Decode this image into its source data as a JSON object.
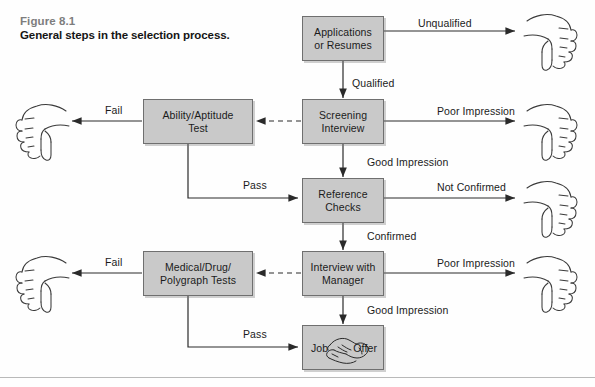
{
  "figure": {
    "number": "Figure 8.1",
    "title": "General steps in the selection process."
  },
  "diagram_type": "flowchart",
  "nodes": [
    {
      "id": "applications",
      "label": "Applications\nor Resumes",
      "column": "center",
      "x": 302,
      "y": 16,
      "w": 82,
      "h": 45
    },
    {
      "id": "screening",
      "label": "Screening\nInterview",
      "column": "center",
      "x": 302,
      "y": 99,
      "w": 82,
      "h": 45
    },
    {
      "id": "reference",
      "label": "Reference\nChecks",
      "column": "center",
      "x": 302,
      "y": 178,
      "w": 82,
      "h": 45
    },
    {
      "id": "interview",
      "label": "Interview with\nManager",
      "column": "center",
      "x": 302,
      "y": 251,
      "w": 82,
      "h": 45
    },
    {
      "id": "joboffer",
      "label": "",
      "column": "center",
      "x": 302,
      "y": 325,
      "w": 82,
      "h": 45
    },
    {
      "id": "ability",
      "label": "Ability/Aptitude\nTest",
      "column": "left",
      "x": 143,
      "y": 99,
      "w": 110,
      "h": 45
    },
    {
      "id": "medical",
      "label": "Medical/Drug/\nPolygraph Tests",
      "column": "left",
      "x": 143,
      "y": 251,
      "w": 110,
      "h": 45
    }
  ],
  "job_offer": {
    "word_left": "Job",
    "word_right": "Offer",
    "icon": "handshake-icon"
  },
  "edge_labels": {
    "unqualified": "Unqualified",
    "qualified": "Qualified",
    "fail_top": "Fail",
    "poor_impression_top": "Poor Impression",
    "good_impression_top": "Good Impression",
    "pass_top": "Pass",
    "not_confirmed": "Not Confirmed",
    "confirmed": "Confirmed",
    "fail_bottom": "Fail",
    "poor_impression_bottom": "Poor Impression",
    "good_impression_bottom": "Good Impression",
    "pass_bottom": "Pass"
  },
  "rejection_icons": [
    {
      "id": "reject-unqualified",
      "icon": "thumbs-down-icon",
      "facing": "right"
    },
    {
      "id": "reject-fail-top",
      "icon": "thumbs-down-icon",
      "facing": "left"
    },
    {
      "id": "reject-poor-top",
      "icon": "thumbs-down-icon",
      "facing": "right"
    },
    {
      "id": "reject-not-confirmed",
      "icon": "thumbs-down-icon",
      "facing": "right"
    },
    {
      "id": "reject-fail-bottom",
      "icon": "thumbs-down-icon",
      "facing": "left"
    },
    {
      "id": "reject-poor-bottom",
      "icon": "thumbs-down-icon",
      "facing": "right"
    }
  ],
  "colors": {
    "box_fill": "#c9c9c9",
    "box_border": "#6f6f6f",
    "line": "#2a2a2a",
    "text": "#1b1b1b",
    "figure_number": "#7d7d7d",
    "background": "#fefefe"
  }
}
